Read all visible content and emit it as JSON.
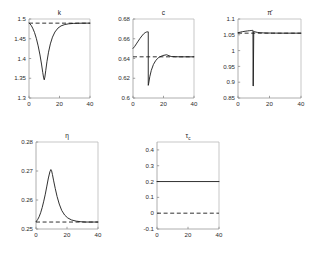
{
  "figure": {
    "background": "#ffffff",
    "curve_color": "#1a1a1a",
    "axis_color": "#8a8a8a",
    "layout": "2 rows: 3 panels top, 2 panels bottom",
    "panel_count": 5
  },
  "chart_data": [
    {
      "id": "k",
      "type": "line",
      "title": "k",
      "title_symbol": "k",
      "xlabel": "",
      "ylabel": "",
      "xlim": [
        0,
        40
      ],
      "ylim": [
        1.3,
        1.5
      ],
      "xticks": [
        0,
        20,
        40
      ],
      "yticks": [
        1.3,
        1.35,
        1.4,
        1.45,
        1.5
      ],
      "xticklabels": [
        "0",
        "20",
        "40"
      ],
      "yticklabels": [
        "1.3",
        "1.35",
        "1.4",
        "1.45",
        "1.5"
      ],
      "grid": false,
      "legend": null,
      "series": [
        {
          "name": "response",
          "style": "solid",
          "x": [
            0,
            0.6,
            1.4,
            2.4,
            3.6,
            4.8,
            6.0,
            7.2,
            8.2,
            9.0,
            9.6,
            10.0,
            10.4,
            11.0,
            11.8,
            12.8,
            14.0,
            15.4,
            17.0,
            19.0,
            21.0,
            23.5,
            26.0,
            29.0,
            32.0,
            35.0,
            38.0,
            40.0
          ],
          "y": [
            1.4895,
            1.488,
            1.484,
            1.477,
            1.466,
            1.451,
            1.432,
            1.409,
            1.386,
            1.365,
            1.351,
            1.346,
            1.353,
            1.37,
            1.393,
            1.416,
            1.437,
            1.454,
            1.467,
            1.477,
            1.4825,
            1.486,
            1.4878,
            1.4888,
            1.4892,
            1.4894,
            1.4895,
            1.4895
          ]
        },
        {
          "name": "steady-state",
          "style": "dashed",
          "x": [
            0,
            40
          ],
          "y": [
            1.4895,
            1.4895
          ]
        }
      ]
    },
    {
      "id": "c",
      "type": "line",
      "title": "c",
      "title_symbol": "c",
      "xlabel": "",
      "ylabel": "",
      "xlim": [
        0,
        40
      ],
      "ylim": [
        0.6,
        0.68
      ],
      "xticks": [
        0,
        20,
        40
      ],
      "yticks": [
        0.6,
        0.62,
        0.64,
        0.66,
        0.68
      ],
      "xticklabels": [
        "0",
        "20",
        "40"
      ],
      "yticklabels": [
        "0.6",
        "0.62",
        "0.64",
        "0.66",
        "0.68"
      ],
      "grid": false,
      "legend": null,
      "series": [
        {
          "name": "response",
          "style": "solid",
          "x": [
            0,
            1.0,
            2.2,
            3.4,
            4.6,
            5.8,
            7.0,
            8.0,
            8.8,
            9.4,
            9.8,
            10.0,
            10.0,
            10.3,
            11.0,
            12.0,
            13.4,
            15.0,
            17.0,
            19.5,
            22.0,
            25.0,
            28.0,
            31.0,
            34.0,
            37.0,
            40.0
          ],
          "y": [
            0.6502,
            0.652,
            0.6548,
            0.6576,
            0.6604,
            0.6628,
            0.665,
            0.6662,
            0.6668,
            0.667,
            0.667,
            0.667,
            0.6128,
            0.615,
            0.6215,
            0.628,
            0.634,
            0.6382,
            0.6412,
            0.643,
            0.6438,
            0.642,
            0.6418,
            0.6417,
            0.6417,
            0.6417,
            0.6417
          ]
        },
        {
          "name": "steady-state",
          "style": "dashed",
          "x": [
            0,
            40
          ],
          "y": [
            0.6417,
            0.6417
          ]
        }
      ]
    },
    {
      "id": "pi_bar",
      "type": "line",
      "title": "π̄",
      "title_symbol": "pi-bar",
      "xlabel": "",
      "ylabel": "",
      "xlim": [
        0,
        40
      ],
      "ylim": [
        0.85,
        1.1
      ],
      "xticks": [
        0,
        20,
        40
      ],
      "yticks": [
        0.85,
        0.9,
        0.95,
        1.0,
        1.05,
        1.1
      ],
      "xticklabels": [
        "0",
        "20",
        "40"
      ],
      "yticklabels": [
        "0.85",
        "0.9",
        "0.95",
        "1",
        "1.05",
        "1.1"
      ],
      "grid": false,
      "legend": null,
      "series": [
        {
          "name": "response",
          "style": "solid",
          "x": [
            0,
            1.5,
            3.0,
            4.5,
            6.0,
            7.2,
            8.2,
            8.8,
            9.2,
            9.5,
            9.6,
            9.7,
            10.0,
            10.2,
            10.6,
            11.4,
            12.5,
            14.0,
            16.0,
            19.0,
            22.0,
            26.0,
            30.0,
            34.0,
            40.0
          ],
          "y": [
            1.0565,
            1.0585,
            1.06,
            1.0612,
            1.0622,
            1.063,
            1.0636,
            1.0638,
            1.064,
            1.064,
            0.888,
            0.888,
            1.061,
            1.0605,
            1.0598,
            1.0586,
            1.0575,
            1.0566,
            1.056,
            1.0556,
            1.0554,
            1.0553,
            1.0552,
            1.0552,
            1.0552
          ]
        },
        {
          "name": "steady-state",
          "style": "dashed",
          "x": [
            0,
            40
          ],
          "y": [
            1.0552,
            1.0552
          ]
        }
      ]
    },
    {
      "id": "eta",
      "type": "line",
      "title": "η",
      "title_symbol": "eta",
      "xlabel": "",
      "ylabel": "",
      "xlim": [
        0,
        40
      ],
      "ylim": [
        0.25,
        0.28
      ],
      "xticks": [
        0,
        20,
        40
      ],
      "yticks": [
        0.25,
        0.26,
        0.27,
        0.28
      ],
      "xticklabels": [
        "0",
        "20",
        "40"
      ],
      "yticklabels": [
        "0.25",
        "0.26",
        "0.27",
        "0.28"
      ],
      "grid": false,
      "legend": null,
      "series": [
        {
          "name": "response",
          "style": "solid",
          "x": [
            0,
            1.0,
            2.0,
            3.0,
            4.0,
            5.0,
            6.0,
            7.0,
            8.0,
            9.0,
            9.6,
            10.0,
            10.6,
            11.4,
            12.4,
            13.6,
            15.0,
            16.6,
            18.5,
            20.5,
            23.0,
            26.0,
            29.0,
            32.0,
            35.0,
            38.0,
            40.0
          ],
          "y": [
            0.2525,
            0.2532,
            0.2542,
            0.2556,
            0.2574,
            0.2596,
            0.262,
            0.2648,
            0.2676,
            0.2698,
            0.2705,
            0.2702,
            0.2688,
            0.2666,
            0.264,
            0.2612,
            0.2586,
            0.2564,
            0.2548,
            0.2538,
            0.2531,
            0.2527,
            0.2525,
            0.2524,
            0.2524,
            0.2524,
            0.2524
          ]
        },
        {
          "name": "steady-state",
          "style": "dashed",
          "x": [
            0,
            40
          ],
          "y": [
            0.2524,
            0.2524
          ]
        }
      ]
    },
    {
      "id": "tau_c",
      "type": "line",
      "title": "τc",
      "title_symbol": "tau-c",
      "title_base": "τ",
      "title_subscript": "c",
      "xlabel": "",
      "ylabel": "",
      "xlim": [
        0,
        40
      ],
      "ylim": [
        -0.1,
        0.45
      ],
      "xticks": [
        0,
        20,
        40
      ],
      "yticks": [
        -0.1,
        0,
        0.1,
        0.2,
        0.3,
        0.4
      ],
      "xticklabels": [
        "0",
        "20",
        "40"
      ],
      "yticklabels": [
        "-0.1",
        "0",
        "0.1",
        "0.2",
        "0.3",
        "0.4"
      ],
      "grid": false,
      "legend": null,
      "series": [
        {
          "name": "response",
          "style": "solid",
          "x": [
            0,
            40
          ],
          "y": [
            0.2,
            0.2
          ]
        },
        {
          "name": "steady-state",
          "style": "dashed",
          "x": [
            0,
            40
          ],
          "y": [
            0.0,
            0.0
          ]
        }
      ]
    }
  ]
}
